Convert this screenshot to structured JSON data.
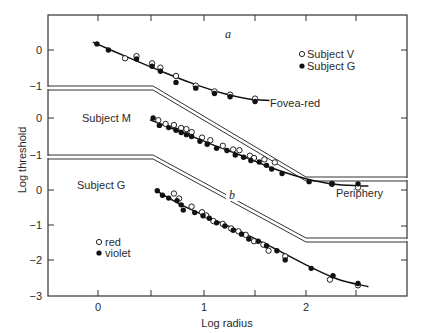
{
  "chart_data": {
    "type": "scatter",
    "title": "",
    "xlabel": "Log radius",
    "ylabel": "Log threshold",
    "xlim": [
      -0.47,
      2.9
    ],
    "x_ticks": [
      0,
      0.5,
      1,
      1.5,
      2,
      2.5
    ],
    "x_tick_labels": [
      "0",
      "",
      "1",
      "",
      "2",
      ""
    ],
    "grid": false,
    "panels": [
      {
        "id": "a",
        "label": "a",
        "curve_label": "Fovea-red",
        "y_ticks": [
          0,
          -1
        ],
        "ylim": [
          -1.0,
          1.0
        ],
        "legend": [
          "Subject V",
          "Subject G"
        ],
        "series": [
          {
            "name": "Subject V",
            "marker": "open-circle",
            "x": [
              0.26,
              0.37,
              0.52,
              0.6,
              0.75,
              0.94,
              1.12,
              1.27,
              1.51
            ],
            "y": [
              -0.23,
              -0.17,
              -0.37,
              -0.49,
              -0.72,
              -0.99,
              -1.15,
              -1.24,
              -1.35
            ]
          },
          {
            "name": "Subject G",
            "marker": "filled-circle",
            "x": [
              -0.01,
              0.1,
              0.37,
              0.52,
              0.6,
              0.75,
              0.94,
              1.12,
              1.27,
              1.51
            ],
            "y": [
              0.17,
              0.0,
              -0.25,
              -0.45,
              -0.59,
              -0.9,
              -1.06,
              -1.21,
              -1.3,
              -1.43
            ]
          }
        ],
        "fit_curve": {
          "x": [
            -0.05,
            0.3,
            0.6,
            0.9,
            1.2,
            1.45,
            1.65
          ],
          "y": [
            0.22,
            -0.22,
            -0.58,
            -0.92,
            -1.2,
            -1.36,
            -1.4
          ]
        }
      },
      {
        "id": "subject-m",
        "label": "Subject M",
        "curve_label": "Periphery",
        "y_ticks": [
          0,
          -1
        ],
        "series": [
          {
            "name": "red",
            "marker": "open-circle",
            "x": [
              0.58,
              0.65,
              0.73,
              0.8,
              0.85,
              0.9,
              1.0,
              1.08,
              1.2,
              1.3,
              1.36,
              1.46,
              1.5,
              1.6,
              1.7,
              2.25,
              2.5
            ],
            "y": [
              -0.06,
              -0.16,
              -0.19,
              -0.27,
              -0.3,
              -0.38,
              -0.53,
              -0.6,
              -0.75,
              -0.85,
              -0.87,
              -1.02,
              -1.08,
              -1.12,
              -1.2,
              -1.78,
              -1.88
            ]
          },
          {
            "name": "violet",
            "marker": "filled-circle",
            "x": [
              0.53,
              0.59,
              0.68,
              0.75,
              0.8,
              0.85,
              0.9,
              0.98,
              1.05,
              1.14,
              1.24,
              1.32,
              1.4,
              1.47,
              1.55,
              1.62,
              1.67,
              1.77,
              2.03,
              2.25,
              2.5
            ],
            "y": [
              0.0,
              -0.2,
              -0.26,
              -0.33,
              -0.39,
              -0.45,
              -0.5,
              -0.63,
              -0.71,
              -0.82,
              -0.88,
              -1.0,
              -1.06,
              -1.15,
              -1.19,
              -1.28,
              -1.38,
              -1.5,
              -1.72,
              -1.78,
              -1.78
            ]
          }
        ],
        "fit_curve": {
          "x": [
            0.5,
            0.8,
            1.1,
            1.4,
            1.7,
            2.0,
            2.3,
            2.6
          ],
          "y": [
            -0.05,
            -0.38,
            -0.72,
            -1.04,
            -1.38,
            -1.64,
            -1.8,
            -1.84
          ]
        }
      },
      {
        "id": "b",
        "label": "Subject G",
        "panel_letter": "b",
        "y_ticks": [
          0,
          -1,
          -2,
          -3
        ],
        "ylim": [
          -3.0,
          0.9
        ],
        "legend": [
          "red",
          "violet"
        ],
        "series": [
          {
            "name": "red",
            "marker": "open-circle",
            "x": [
              0.73,
              0.78,
              0.9,
              1.0,
              1.04,
              1.11,
              1.2,
              1.28,
              1.35,
              1.42,
              1.5,
              1.59,
              1.64,
              1.8,
              2.23,
              2.5
            ],
            "y": [
              -0.1,
              -0.24,
              -0.47,
              -0.63,
              -0.72,
              -0.88,
              -0.96,
              -1.09,
              -1.17,
              -1.27,
              -1.45,
              -1.55,
              -1.72,
              -1.88,
              -2.54,
              -2.7
            ]
          },
          {
            "name": "violet",
            "marker": "filled-circle",
            "x": [
              0.57,
              0.62,
              0.68,
              0.76,
              0.8,
              0.82,
              0.93,
              1.01,
              1.07,
              1.14,
              1.22,
              1.3,
              1.38,
              1.45,
              1.54,
              1.62,
              1.72,
              1.8,
              2.05,
              2.26,
              2.5
            ],
            "y": [
              -0.02,
              -0.15,
              -0.23,
              -0.3,
              -0.42,
              -0.57,
              -0.64,
              -0.73,
              -0.8,
              -0.93,
              -1.02,
              -1.14,
              -1.25,
              -1.39,
              -1.45,
              -1.58,
              -1.72,
              -1.98,
              -2.22,
              -2.43,
              -2.65
            ]
          }
        ],
        "fit_curve": {
          "x": [
            0.55,
            0.8,
            1.1,
            1.4,
            1.7,
            2.0,
            2.3,
            2.6
          ],
          "y": [
            0.0,
            -0.42,
            -0.82,
            -1.22,
            -1.66,
            -2.12,
            -2.52,
            -2.74
          ]
        }
      }
    ],
    "annotations": [
      "a",
      "b",
      "Fovea-red",
      "Periphery",
      "Subject M",
      "Subject G"
    ]
  },
  "labels": {
    "xlabel": "Log radius",
    "ylabel": "Log threshold",
    "panel_a": "a",
    "panel_b": "b",
    "fovea": "Fovea-red",
    "periphery": "Periphery",
    "subject_m": "Subject M",
    "subject_g": "Subject G",
    "legend_top_1": "Subject V",
    "legend_top_2": "Subject G",
    "legend_bot_1": "red",
    "legend_bot_2": "violet",
    "x_tick_0": "0",
    "x_tick_1": "1",
    "x_tick_2": "2",
    "y_top_0": "0",
    "y_top_m1": "−1",
    "y_mid_0": "0",
    "y_mid_m1": "−1",
    "y_bot_0": "0",
    "y_bot_m1": "−1",
    "y_bot_m2": "−2",
    "y_bot_m3": "−3"
  }
}
